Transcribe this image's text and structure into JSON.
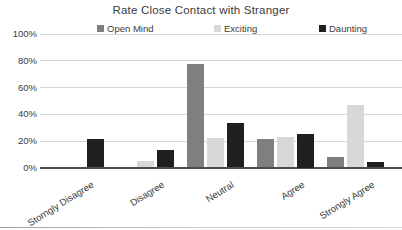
{
  "chart_data": {
    "type": "bar",
    "title": "Rate Close Contact with Stranger",
    "categories": [
      "Storngly Disagree",
      "Disagree",
      "Neutral",
      "Agree",
      "Strongly Agree"
    ],
    "series": [
      {
        "name": "Open Mind",
        "color": "#7f7f7f",
        "values": [
          0,
          0,
          77,
          21,
          8
        ]
      },
      {
        "name": "Exciting",
        "color": "#d8d8d8",
        "values": [
          0,
          5,
          22,
          23,
          47
        ]
      },
      {
        "name": "Daunting",
        "color": "#1f1f1f",
        "values": [
          21,
          13,
          33,
          25,
          4
        ]
      }
    ],
    "xlabel": "",
    "ylabel": "",
    "ylim": [
      0,
      100
    ],
    "ytick_step": 20,
    "ytick_labels": [
      "0%",
      "20%",
      "40%",
      "60%",
      "80%",
      "100%"
    ],
    "grid": true,
    "legend_position": "top-horizontal"
  },
  "colors": {
    "gridline": "#d7d7d7",
    "axis_line": "#4d4d4d",
    "text": "#3b3b3b",
    "background": "#ffffff"
  }
}
